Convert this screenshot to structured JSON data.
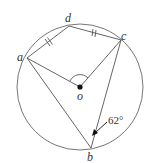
{
  "diagram": {
    "type": "circle-geometry",
    "circle": {
      "cx": 80,
      "cy": 87,
      "r": 63
    },
    "points": {
      "a": {
        "label": "a",
        "x": 27,
        "y": 58
      },
      "d": {
        "label": "d",
        "x": 69,
        "y": 26
      },
      "c": {
        "label": "c",
        "x": 121,
        "y": 40
      },
      "b": {
        "label": "b",
        "x": 91,
        "y": 148
      },
      "o": {
        "label": "o",
        "x": 80,
        "y": 87
      }
    },
    "segments": [
      "a-d",
      "d-c",
      "a-o",
      "o-c",
      "a-b",
      "c-b"
    ],
    "equal_marks": [
      "a-d",
      "d-c"
    ],
    "angle_label": "62°",
    "angle_at": "b",
    "center_angle_marked": "a-o-c",
    "stroke_color": "#555555"
  }
}
